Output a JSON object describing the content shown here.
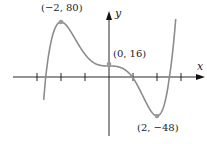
{
  "chart_data": {
    "type": "line",
    "title": "",
    "xlabel": "x",
    "ylabel": "y",
    "function": "3x^5 - 20x^3 + 16",
    "x_ticks": [
      -3,
      -2,
      -1,
      0,
      1,
      2,
      3
    ],
    "tick_labels_shown": false,
    "grid": false,
    "xlim": [
      -4,
      4
    ],
    "series": [
      {
        "name": "f(x)",
        "color": "#8c8c8c",
        "x": [
          -2.7,
          -2.5,
          -2.25,
          -2,
          -1.75,
          -1.5,
          -1.25,
          -1,
          -0.75,
          -0.5,
          -0.25,
          0,
          0.25,
          0.5,
          0.75,
          1,
          1.25,
          1.5,
          1.75,
          2,
          2.25,
          2.5,
          2.7
        ],
        "values": [
          -5.7,
          16.3,
          68.1,
          80,
          72.6,
          60.7,
          45.3,
          33,
          23.7,
          18.4,
          16.3,
          16,
          15.7,
          13.6,
          8.3,
          -1,
          -13.3,
          -28.7,
          -40.6,
          -48,
          -36.1,
          15.7,
          37.7
        ]
      }
    ],
    "annotations": [
      {
        "label": "(−2, 80)",
        "x": -2,
        "y": 80
      },
      {
        "label": "(0, 16)",
        "x": 0,
        "y": 16
      },
      {
        "label": "(2, −48)",
        "x": 2,
        "y": -48
      }
    ]
  },
  "labels": {
    "x_axis": "x",
    "y_axis": "y",
    "max_point": "(−2, 80)",
    "y_intercept": "(0, 16)",
    "min_point": "(2, −48)"
  },
  "colors": {
    "curve": "#8c8c8c",
    "axis": "#111111",
    "point": "#9a9a9a"
  }
}
